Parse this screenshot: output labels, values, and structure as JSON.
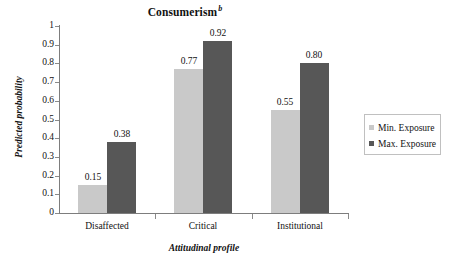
{
  "chart_data": {
    "type": "bar",
    "title": "Consumerism",
    "title_superscript": "b",
    "xlabel": "Attitudinal profile",
    "ylabel": "Predicted probability",
    "categories": [
      "Disaffected",
      "Critical",
      "Institutional"
    ],
    "series": [
      {
        "name": "Min. Exposure",
        "color": "#c9c9c9",
        "values": [
          0.15,
          0.77,
          0.55
        ],
        "labels": [
          "0.15",
          "0.77",
          "0.55"
        ]
      },
      {
        "name": "Max. Exposure",
        "color": "#575757",
        "values": [
          0.38,
          0.92,
          0.8
        ],
        "labels": [
          "0.38",
          "0.92",
          "0.80"
        ]
      }
    ],
    "ylim": [
      0,
      1
    ],
    "ytick_values": [
      0,
      0.1,
      0.2,
      0.3,
      0.4,
      0.5,
      0.6,
      0.7,
      0.8,
      0.9,
      1
    ],
    "ytick_labels": [
      "0",
      "0.1",
      "0.2",
      "0.3",
      "0.4",
      "0.5",
      "0.6",
      "0.7",
      "0.8",
      "0.9",
      "1"
    ],
    "grid": false,
    "legend_position": "right"
  },
  "legend": {
    "entries": [
      {
        "label": "Min. Exposure"
      },
      {
        "label": "Max. Exposure"
      }
    ]
  }
}
